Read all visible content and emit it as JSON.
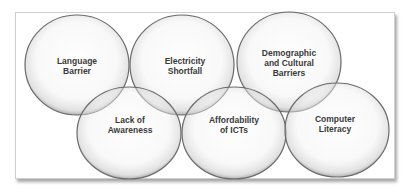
{
  "diagram": {
    "type": "overlapping-ellipses",
    "nodes": [
      {
        "id": "language-barrier",
        "lines": [
          "Language",
          "Barrier"
        ],
        "cx": 77,
        "cy": 65,
        "rx": 52,
        "ry": 50
      },
      {
        "id": "electricity-shortfall",
        "lines": [
          "Electricity",
          "Shortfall"
        ],
        "cx": 182,
        "cy": 65,
        "rx": 52,
        "ry": 50
      },
      {
        "id": "demographic-cultural-barriers",
        "lines": [
          "Demographic",
          "and Cultural",
          "Barriers"
        ],
        "cx": 289,
        "cy": 62,
        "rx": 52,
        "ry": 50
      },
      {
        "id": "lack-of-awareness",
        "lines": [
          "Lack of",
          "Awareness"
        ],
        "cx": 129,
        "cy": 133,
        "rx": 52,
        "ry": 46
      },
      {
        "id": "affordability-of-icts",
        "lines": [
          "Affordability",
          "of ICTs"
        ],
        "cx": 234,
        "cy": 133,
        "rx": 52,
        "ry": 46
      },
      {
        "id": "computer-literacy",
        "lines": [
          "Computer",
          "Literacy"
        ],
        "cx": 337,
        "cy": 130,
        "rx": 52,
        "ry": 47
      }
    ],
    "labels": {
      "language_barrier": "Language\nBarrier",
      "electricity_shortfall": "Electricity\nShortfall",
      "demographic": "Demographic\nand Cultural\nBarriers",
      "lack_of_awareness": "Lack of\nAwareness",
      "affordability": "Affordability\nof ICTs",
      "computer_literacy": "Computer\nLiteracy"
    },
    "colors": {
      "ellipse_fill": "#f4f4f4",
      "ellipse_stroke": "#6a6a6a",
      "text": "#3a3a3a",
      "frame_border": "#cfcfcf"
    }
  }
}
